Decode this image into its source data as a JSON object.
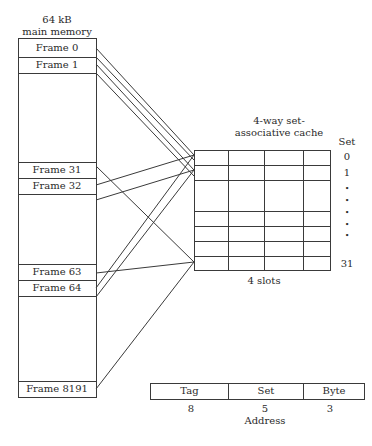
{
  "memory": {
    "title_line1": "64 kB",
    "title_line2": "main memory",
    "frames": [
      {
        "label": "Frame 0"
      },
      {
        "label": "Frame 1"
      },
      {
        "label": "Frame 31"
      },
      {
        "label": "Frame 32"
      },
      {
        "label": "Frame 63"
      },
      {
        "label": "Frame 64"
      },
      {
        "label": "Frame 8191"
      }
    ]
  },
  "cache": {
    "title_line1": "4-way set-",
    "title_line2": "associative cache",
    "set_header": "Set",
    "set_labels": [
      "0",
      "1",
      "•",
      "•",
      "•",
      "•",
      "•",
      "31"
    ],
    "slots_label": "4 slots",
    "ways": 4,
    "sets": 32
  },
  "address": {
    "fields": [
      {
        "name": "Tag",
        "bits": "8"
      },
      {
        "name": "Set",
        "bits": "5"
      },
      {
        "name": "Byte",
        "bits": "3"
      }
    ],
    "caption": "Address"
  },
  "mappings": [
    {
      "from": "Frame 0",
      "to_set": "0"
    },
    {
      "from": "Frame 1",
      "to_set": "1"
    },
    {
      "from": "Frame 31",
      "to_set": "31"
    },
    {
      "from": "Frame 32",
      "to_set": "0"
    },
    {
      "from": "Frame 63",
      "to_set": "31"
    },
    {
      "from": "Frame 64",
      "to_set": "0"
    },
    {
      "from": "Frame 8191",
      "to_set": "31"
    }
  ]
}
